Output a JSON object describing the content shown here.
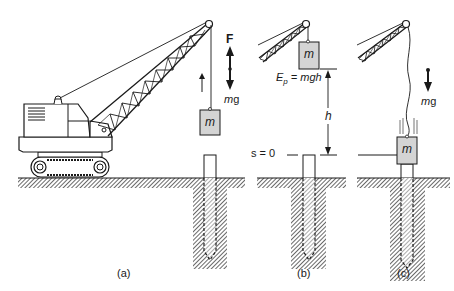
{
  "figure": {
    "panels": [
      {
        "id": "a",
        "caption": "(a)",
        "description": "Crane lifting mass above pile",
        "mass_label": "m",
        "force_up_label": "F",
        "force_down_label_m": "m",
        "force_down_label_g": "g"
      },
      {
        "id": "b",
        "caption": "(b)",
        "description": "Mass raised to height h above reference",
        "mass_label": "m",
        "energy_label_E": "E",
        "energy_label_sub": "p",
        "energy_label_eq": " = mgh",
        "height_label": "h",
        "reference_label": "s = 0"
      },
      {
        "id": "c",
        "caption": "(c)",
        "description": "Mass released and striking pile",
        "mass_label": "m",
        "force_down_label_m": "m",
        "force_down_label_g": "g"
      }
    ]
  },
  "colors": {
    "line": "#1a1a1a",
    "mass_fill": "#d4d4d4",
    "hatch": "#333333",
    "background": "#ffffff"
  }
}
